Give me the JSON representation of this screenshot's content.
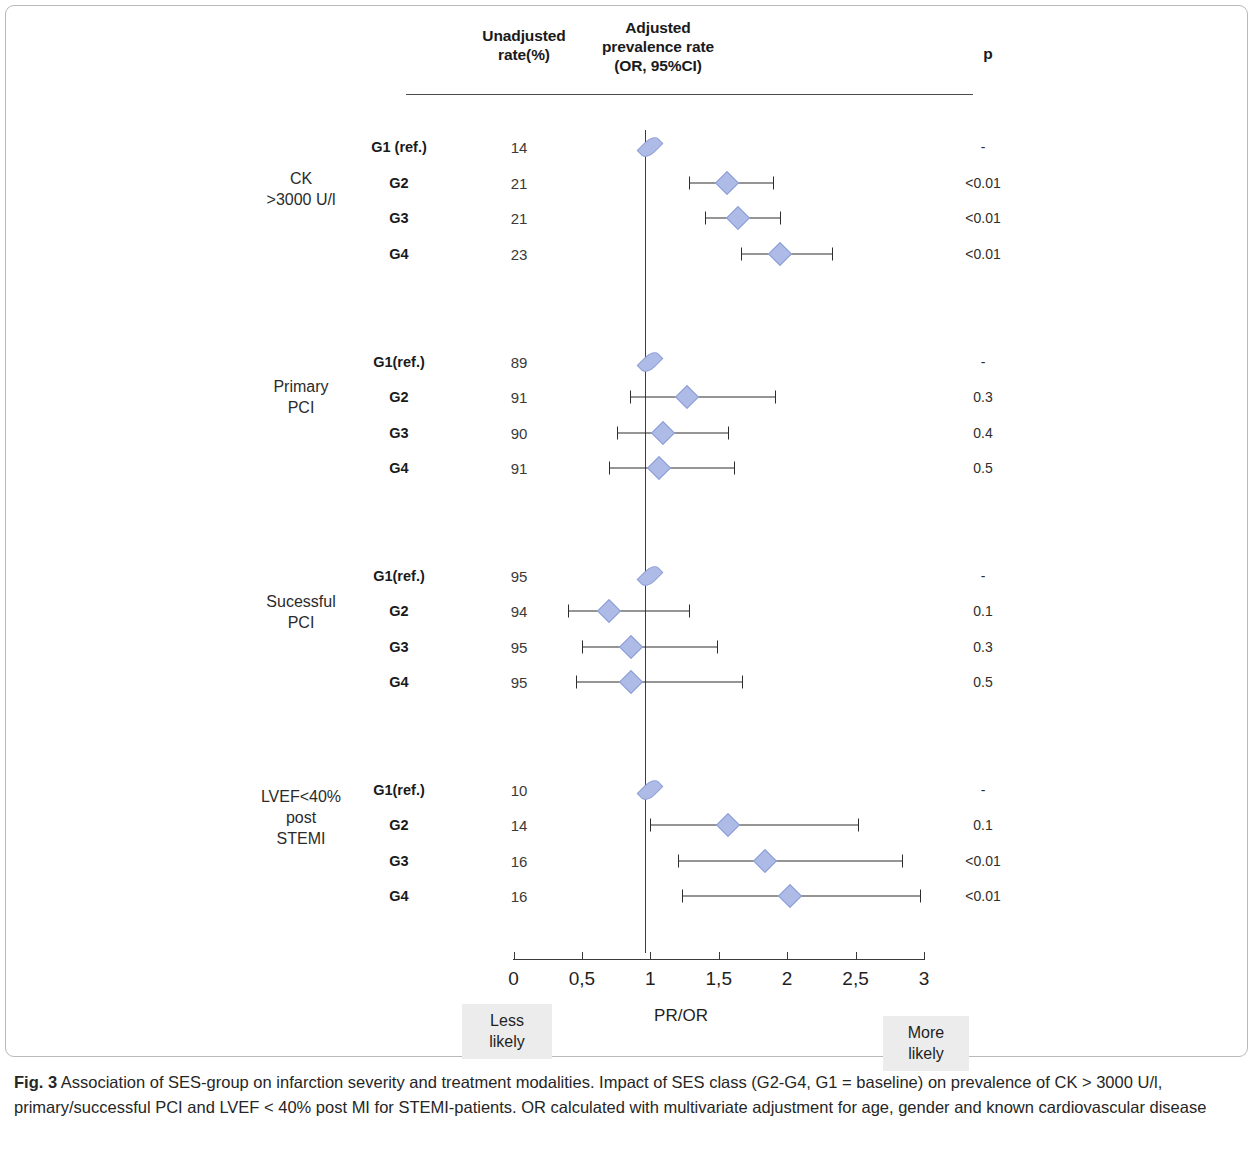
{
  "figure": {
    "caption_label": "Fig. 3",
    "caption_text": " Association of SES-group on infarction severity and treatment modalities. Impact of SES class (G2-G4, G1 = baseline) on prevalence of CK > 3000 U/l, primary/successful PCI and LVEF < 40% post MI for STEMI-patients. OR calculated with multivariate adjustment for age, gender and known cardiovascular disease"
  },
  "headers": {
    "unadjusted": "Unadjusted\nrate(%)",
    "unadjusted_line1": "Unadjusted",
    "unadjusted_line2": "rate(%)",
    "adjusted_line1": "Adjusted",
    "adjusted_line2": "prevalence rate",
    "adjusted_line3": "(OR, 95%CI)",
    "p": "p"
  },
  "axis": {
    "title": "PR/OR",
    "tick_labels": [
      "0",
      "0,5",
      "1",
      "1,5",
      "2",
      "2,5",
      "3"
    ],
    "tick_values": [
      0,
      0.5,
      1,
      1.5,
      2,
      2.5,
      3
    ],
    "less_likely_line1": "Less",
    "less_likely_line2": "likely",
    "more_likely_line1": "More",
    "more_likely_line2": "likely"
  },
  "colors": {
    "marker_fill": "#aebbe6",
    "marker_edge": "#8d9ed8",
    "line": "#2d2d2d",
    "panel_border": "#b9b9b9",
    "likely_box_bg": "#ececec"
  },
  "chart_data": {
    "type": "forest",
    "title": "Association of SES-group on infarction severity and treatment modalities",
    "xlabel": "PR/OR",
    "xlim": [
      0,
      3
    ],
    "reference_line": 1,
    "grid": false,
    "columns": [
      "",
      "Unadjusted rate(%)",
      "Adjusted prevalence rate (OR, 95%CI)",
      "p"
    ],
    "blocks": [
      {
        "label_line1": "CK",
        "label_line2": ">3000 U/l",
        "rows": [
          {
            "group": "G1 (ref.)",
            "rate": "14",
            "or": 1.0,
            "ci_low": null,
            "ci_high": null,
            "p": "-"
          },
          {
            "group": "G2",
            "rate": "21",
            "or": 1.56,
            "ci_low": 1.28,
            "ci_high": 1.9,
            "p": "<0.01"
          },
          {
            "group": "G3",
            "rate": "21",
            "or": 1.64,
            "ci_low": 1.4,
            "ci_high": 1.95,
            "p": "<0.01"
          },
          {
            "group": "G4",
            "rate": "23",
            "or": 1.95,
            "ci_low": 1.66,
            "ci_high": 2.33,
            "p": "<0.01"
          }
        ]
      },
      {
        "label_line1": "Primary",
        "label_line2": "PCI",
        "rows": [
          {
            "group": "G1(ref.)",
            "rate": "89",
            "or": 1.0,
            "ci_low": null,
            "ci_high": null,
            "p": "-"
          },
          {
            "group": "G2",
            "rate": "91",
            "or": 1.27,
            "ci_low": 0.85,
            "ci_high": 1.91,
            "p": "0.3"
          },
          {
            "group": "G3",
            "rate": "90",
            "or": 1.09,
            "ci_low": 0.76,
            "ci_high": 1.57,
            "p": "0.4"
          },
          {
            "group": "G4",
            "rate": "91",
            "or": 1.06,
            "ci_low": 0.7,
            "ci_high": 1.61,
            "p": "0.5"
          }
        ]
      },
      {
        "label_line1": "Sucessful",
        "label_line2": "PCI",
        "rows": [
          {
            "group": "G1(ref.)",
            "rate": "95",
            "or": 1.0,
            "ci_low": null,
            "ci_high": null,
            "p": "-"
          },
          {
            "group": "G2",
            "rate": "94",
            "or": 0.7,
            "ci_low": 0.4,
            "ci_high": 1.28,
            "p": "0.1"
          },
          {
            "group": "G3",
            "rate": "95",
            "or": 0.86,
            "ci_low": 0.5,
            "ci_high": 1.49,
            "p": "0.3"
          },
          {
            "group": "G4",
            "rate": "95",
            "or": 0.86,
            "ci_low": 0.46,
            "ci_high": 1.67,
            "p": "0.5"
          }
        ]
      },
      {
        "label_line1": "LVEF<40%",
        "label_line2": "post",
        "label_line3": "STEMI",
        "rows": [
          {
            "group": "G1(ref.)",
            "rate": "10",
            "or": 1.0,
            "ci_low": null,
            "ci_high": null,
            "p": "-"
          },
          {
            "group": "G2",
            "rate": "14",
            "or": 1.57,
            "ci_low": 1.0,
            "ci_high": 2.52,
            "p": "0.1"
          },
          {
            "group": "G3",
            "rate": "16",
            "or": 1.84,
            "ci_low": 1.2,
            "ci_high": 2.84,
            "p": "<0.01"
          },
          {
            "group": "G4",
            "rate": "16",
            "or": 2.02,
            "ci_low": 1.23,
            "ci_high": 2.97,
            "p": "<0.01"
          }
        ]
      }
    ]
  },
  "layout": {
    "row_y": [
      [
        141,
        177,
        212,
        248
      ],
      [
        356,
        391,
        427,
        462
      ],
      [
        570,
        605,
        641,
        676
      ],
      [
        784,
        819,
        855,
        890
      ]
    ],
    "block_label_y": [
      182,
      390,
      605,
      800
    ]
  }
}
